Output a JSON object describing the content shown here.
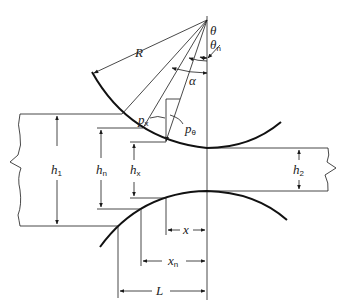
{
  "diagram": {
    "type": "rolling-mill geometry",
    "labels": {
      "R": "R",
      "theta": "θ",
      "theta_n": "θ",
      "theta_n_sub": "n",
      "alpha": "α",
      "p_x": "p",
      "p_x_sub": "x",
      "p_theta": "p",
      "p_theta_sub": "θ",
      "h1": "h",
      "h1_sub": "1",
      "h_n": "h",
      "h_n_sub": "n",
      "h_x": "h",
      "h_x_sub": "x",
      "h2": "h",
      "h2_sub": "2",
      "x": "x",
      "x_n": "x",
      "x_n_sub": "n",
      "L": "L"
    },
    "colors": {
      "line": "#1a1a1a",
      "roll": "#111111",
      "background": "#ffffff"
    }
  }
}
